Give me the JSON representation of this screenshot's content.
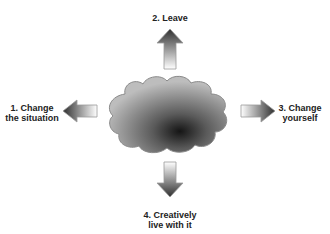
{
  "diagram": {
    "center": {
      "shape": "cloud",
      "meaning": "problem situation"
    },
    "options": [
      {
        "id": 1,
        "label_line1": "1. Change",
        "label_line2": "the situation",
        "direction": "left"
      },
      {
        "id": 2,
        "label_line1": "2. Leave",
        "label_line2": "",
        "direction": "up"
      },
      {
        "id": 3,
        "label_line1": "3. Change",
        "label_line2": "yourself",
        "direction": "right"
      },
      {
        "id": 4,
        "label_line1": "4. Creatively",
        "label_line2": "live with it",
        "direction": "down"
      }
    ],
    "colors": {
      "cloud_dark": "#1a1a1a",
      "cloud_light": "#b5b5b5",
      "cloud_edge": "#8a8a8a",
      "arrow_dark": "#3a3a3a",
      "arrow_light": "#ffffff",
      "text": "#222222"
    }
  }
}
